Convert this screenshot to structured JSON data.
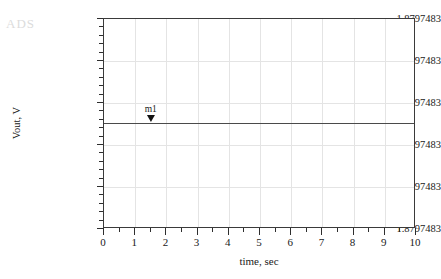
{
  "watermark": {
    "text": "ADS"
  },
  "chart_data": {
    "type": "line",
    "title": "",
    "xlabel": "time, sec",
    "ylabel": "Vout, V",
    "xlim": [
      0,
      10
    ],
    "xticks": [
      0,
      1,
      2,
      3,
      4,
      5,
      6,
      7,
      8,
      9,
      10
    ],
    "xtick_labels": [
      "0",
      "1",
      "2",
      "3",
      "4",
      "5",
      "6",
      "7",
      "8",
      "9",
      "10"
    ],
    "x_minor_tick_step": 0.5,
    "ytick_labels": [
      "1.8797483",
      "1.8797483",
      "1.8797483",
      "1.8797483",
      "1.8797483",
      "1.8797483"
    ],
    "y_minor_ticks_per_major": 5,
    "grid": true,
    "legend": "none",
    "series": [
      {
        "name": "Vout",
        "x": [
          0,
          1,
          2,
          3,
          4,
          5,
          6,
          7,
          8,
          9,
          10
        ],
        "values": [
          1.8797483,
          1.8797483,
          1.8797483,
          1.8797483,
          1.8797483,
          1.8797483,
          1.8797483,
          1.8797483,
          1.8797483,
          1.8797483,
          1.8797483
        ],
        "color": "#4a4a4a"
      }
    ],
    "annotations": [
      {
        "name": "m1",
        "label": "m1",
        "x": 1.5,
        "y": 1.8797483,
        "marker": "down-triangle"
      }
    ]
  }
}
